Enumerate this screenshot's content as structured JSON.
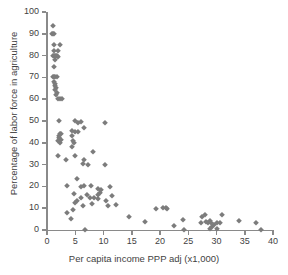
{
  "chart_data": {
    "type": "scatter",
    "title": "",
    "xlabel": "Per capita income PPP adj (x1,000)",
    "ylabel": "Percentage of labor force in agriculture",
    "xlim": [
      0,
      40
    ],
    "ylim": [
      0,
      100
    ],
    "xticks": [
      0,
      5,
      10,
      15,
      20,
      25,
      30,
      35,
      40
    ],
    "yticks": [
      0,
      10,
      20,
      30,
      40,
      50,
      60,
      70,
      80,
      90,
      100
    ],
    "xtick_labels": [
      "0",
      "5",
      "10",
      "15",
      "20",
      "25",
      "30",
      "35",
      "40"
    ],
    "ytick_labels": [
      "0",
      "10",
      "20",
      "30",
      "40",
      "50",
      "60",
      "70",
      "80",
      "90",
      "100"
    ],
    "grid": false,
    "legend": false,
    "marker_shape": "diamond",
    "marker_color": "#7c7c7c",
    "axis_color": "#8a8a8a",
    "series": [
      {
        "name": "Countries",
        "points": [
          [
            1.0,
            93.5
          ],
          [
            0.9,
            90.0
          ],
          [
            1.1,
            90.0
          ],
          [
            1.3,
            90.0
          ],
          [
            1.2,
            85.0
          ],
          [
            2.3,
            85.0
          ],
          [
            1.3,
            82.0
          ],
          [
            2.0,
            82.0
          ],
          [
            1.0,
            80.0
          ],
          [
            1.2,
            80.0
          ],
          [
            1.4,
            80.0
          ],
          [
            1.6,
            80.0
          ],
          [
            1.8,
            80.0
          ],
          [
            2.0,
            79.5
          ],
          [
            1.5,
            78.0
          ],
          [
            1.2,
            75.0
          ],
          [
            1.0,
            70.0
          ],
          [
            1.2,
            70.0
          ],
          [
            1.5,
            70.0
          ],
          [
            1.8,
            70.0
          ],
          [
            1.3,
            68.0
          ],
          [
            1.5,
            67.0
          ],
          [
            1.4,
            66.0
          ],
          [
            1.6,
            65.0
          ],
          [
            1.5,
            64.0
          ],
          [
            1.7,
            63.0
          ],
          [
            1.6,
            62.0
          ],
          [
            2.0,
            60.0
          ],
          [
            2.3,
            60.0
          ],
          [
            2.6,
            60.0
          ],
          [
            2.2,
            50.0
          ],
          [
            5.0,
            50.0
          ],
          [
            6.0,
            49.5
          ],
          [
            5.5,
            49.0
          ],
          [
            10.3,
            49.0
          ],
          [
            6.6,
            47.0
          ],
          [
            4.5,
            45.5
          ],
          [
            5.0,
            45.0
          ],
          [
            5.5,
            45.0
          ],
          [
            2.3,
            44.0
          ],
          [
            2.5,
            44.0
          ],
          [
            2.1,
            43.0
          ],
          [
            4.5,
            43.0
          ],
          [
            2.2,
            42.0
          ],
          [
            2.4,
            41.5
          ],
          [
            2.0,
            41.0
          ],
          [
            4.6,
            41.0
          ],
          [
            2.3,
            40.0
          ],
          [
            4.8,
            40.0
          ],
          [
            4.5,
            38.0
          ],
          [
            8.2,
            36.0
          ],
          [
            2.0,
            34.0
          ],
          [
            5.0,
            34.0
          ],
          [
            6.5,
            32.0
          ],
          [
            3.3,
            32.0
          ],
          [
            6.3,
            30.5
          ],
          [
            7.2,
            30.0
          ],
          [
            10.3,
            30.0
          ],
          [
            5.3,
            23.5
          ],
          [
            3.6,
            20.0
          ],
          [
            6.5,
            20.0
          ],
          [
            7.8,
            20.0
          ],
          [
            6.0,
            19.5
          ],
          [
            11.2,
            19.5
          ],
          [
            9.0,
            19.0
          ],
          [
            9.5,
            18.5
          ],
          [
            9.3,
            17.0
          ],
          [
            4.8,
            16.5
          ],
          [
            7.0,
            16.0
          ],
          [
            9.0,
            16.0
          ],
          [
            11.5,
            15.5
          ],
          [
            6.0,
            14.5
          ],
          [
            7.6,
            14.5
          ],
          [
            8.4,
            14.5
          ],
          [
            9.0,
            14.0
          ],
          [
            5.3,
            13.5
          ],
          [
            10.5,
            13.5
          ],
          [
            5.0,
            12.5
          ],
          [
            8.0,
            12.0
          ],
          [
            12.3,
            11.5
          ],
          [
            6.3,
            11.0
          ],
          [
            10.8,
            11.0
          ],
          [
            20.6,
            10.0
          ],
          [
            21.0,
            10.0
          ],
          [
            21.2,
            9.5
          ],
          [
            19.3,
            9.5
          ],
          [
            3.6,
            8.0
          ],
          [
            4.6,
            9.0
          ],
          [
            14.5,
            6.0
          ],
          [
            24.0,
            4.5
          ],
          [
            28.8,
            4.0
          ],
          [
            27.5,
            6.0
          ],
          [
            28.0,
            7.0
          ],
          [
            31.0,
            7.0
          ],
          [
            4.3,
            5.0
          ],
          [
            17.3,
            3.5
          ],
          [
            22.5,
            2.0
          ],
          [
            27.3,
            3.0
          ],
          [
            28.2,
            3.5
          ],
          [
            28.5,
            3.0
          ],
          [
            29.0,
            3.0
          ],
          [
            29.5,
            2.5
          ],
          [
            30.0,
            3.0
          ],
          [
            30.6,
            3.0
          ],
          [
            29.2,
            1.5
          ],
          [
            34.0,
            4.0
          ],
          [
            37.0,
            3.0
          ],
          [
            6.7,
            0.0
          ],
          [
            24.3,
            0.0
          ],
          [
            28.8,
            0.3
          ],
          [
            30.0,
            0.3
          ],
          [
            37.8,
            0.0
          ]
        ]
      }
    ]
  }
}
